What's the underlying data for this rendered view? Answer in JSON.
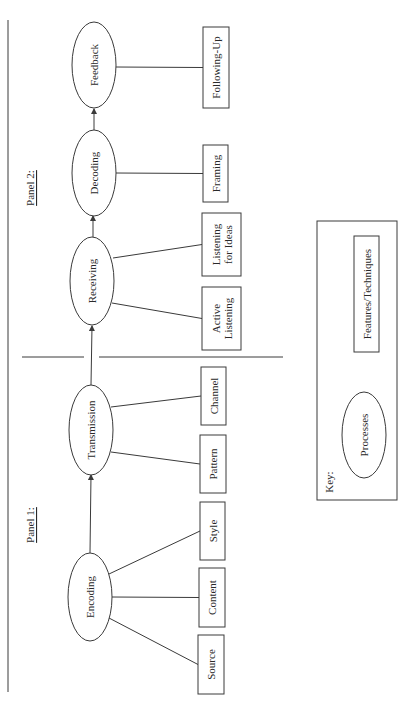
{
  "diagram": {
    "orientation": "rotated-90-ccw",
    "stroke_color": "#3a3a3a",
    "panels": [
      {
        "id": "panel1",
        "label": "Panel 1:",
        "x": 30,
        "y": 525
      },
      {
        "id": "panel2",
        "label": "Panel 2:",
        "x": 30,
        "y": 188
      }
    ],
    "processes": [
      {
        "id": "encoding",
        "label": "Encoding",
        "cx": 90,
        "cy": 597,
        "rx": 22,
        "ry": 44
      },
      {
        "id": "transmission",
        "label": "Transmission",
        "cx": 91,
        "cy": 430,
        "rx": 22,
        "ry": 45
      },
      {
        "id": "receiving",
        "label": "Receiving",
        "cx": 92,
        "cy": 281,
        "rx": 22,
        "ry": 44
      },
      {
        "id": "decoding",
        "label": "Decoding",
        "cx": 94,
        "cy": 173,
        "rx": 22,
        "ry": 43
      },
      {
        "id": "feedback",
        "label": "Feedback",
        "cx": 94,
        "cy": 65,
        "rx": 22,
        "ry": 43
      }
    ],
    "features": [
      {
        "id": "source",
        "lines": [
          "Source"
        ],
        "x": 198,
        "y": 635,
        "w": 26,
        "h": 59,
        "parent": "encoding",
        "attach_x": 109,
        "attach_y": 618
      },
      {
        "id": "content",
        "lines": [
          "Content"
        ],
        "x": 199,
        "y": 568,
        "w": 26,
        "h": 59,
        "parent": "encoding",
        "attach_x": 112,
        "attach_y": 597
      },
      {
        "id": "style",
        "lines": [
          "Style"
        ],
        "x": 200,
        "y": 502,
        "w": 25,
        "h": 58,
        "parent": "encoding",
        "attach_x": 109,
        "attach_y": 574
      },
      {
        "id": "pattern",
        "lines": [
          "Pattern"
        ],
        "x": 200,
        "y": 435,
        "w": 26,
        "h": 58,
        "parent": "transmission",
        "attach_x": 111,
        "attach_y": 452
      },
      {
        "id": "channel",
        "lines": [
          "Channel"
        ],
        "x": 201,
        "y": 367,
        "w": 25,
        "h": 58,
        "parent": "transmission",
        "attach_x": 111,
        "attach_y": 407
      },
      {
        "id": "active-listening",
        "lines": [
          "Active",
          "Listening"
        ],
        "x": 202,
        "y": 287,
        "w": 39,
        "h": 63,
        "parent": "receiving",
        "attach_x": 112,
        "attach_y": 303
      },
      {
        "id": "listening-for-ideas",
        "lines": [
          "Listening",
          "for Ideas"
        ],
        "x": 202,
        "y": 213,
        "w": 39,
        "h": 63,
        "parent": "receiving",
        "attach_x": 113,
        "attach_y": 258
      },
      {
        "id": "framing",
        "lines": [
          "Framing"
        ],
        "x": 203,
        "y": 145,
        "w": 25,
        "h": 57,
        "parent": "decoding",
        "attach_x": 116,
        "attach_y": 173
      },
      {
        "id": "following-up",
        "lines": [
          "Following-Up"
        ],
        "x": 203,
        "y": 27,
        "w": 26,
        "h": 81,
        "parent": "feedback",
        "attach_x": 116,
        "attach_y": 67
      }
    ],
    "arrows": [
      {
        "from": "encoding",
        "to": "transmission",
        "x1": 90,
        "y1": 553,
        "x2": 91,
        "y2": 475
      },
      {
        "from": "transmission",
        "to": "receiving",
        "x1": 91,
        "y1": 385,
        "x2": 92,
        "y2": 326
      },
      {
        "from": "receiving",
        "to": "decoding",
        "x1": 93,
        "y1": 237,
        "x2": 93,
        "y2": 216
      },
      {
        "from": "decoding",
        "to": "feedback",
        "x1": 94,
        "y1": 130,
        "x2": 94,
        "y2": 109
      }
    ],
    "divider": {
      "y": 357,
      "segments": [
        [
          22,
          84
        ],
        [
          99,
          283
        ]
      ]
    },
    "left_rule": {
      "x": 8,
      "y1": 20,
      "y2": 692
    },
    "key": {
      "title": "Key:",
      "x": 317,
      "y": 221,
      "w": 80,
      "h": 279,
      "process_example": {
        "label": "Processes",
        "cx": 364,
        "cy": 435,
        "rx": 22,
        "ry": 43
      },
      "feature_example": {
        "label": "Features/Techniques",
        "x": 354,
        "y": 236,
        "w": 25,
        "h": 116
      }
    }
  }
}
